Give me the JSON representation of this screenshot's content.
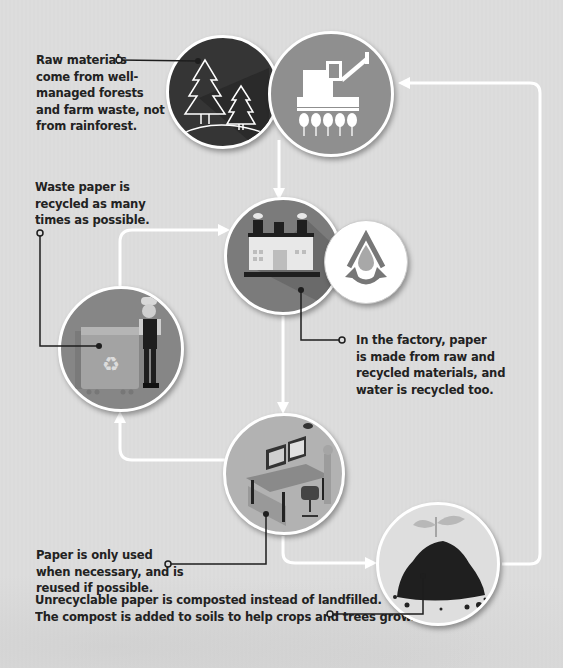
{
  "diagram": {
    "type": "paper-lifecycle-cycle",
    "stages": [
      {
        "id": "forest",
        "icon": "forest-trees-icon",
        "fill": "#3a3a3a"
      },
      {
        "id": "harvest",
        "icon": "combine-harvester-icon",
        "fill": "#8f8f8f"
      },
      {
        "id": "factory",
        "icon": "factory-icon",
        "fill": "#7d7d7d"
      },
      {
        "id": "water",
        "icon": "water-recycle-icon",
        "fill": "#ffffff"
      },
      {
        "id": "recycle",
        "icon": "recycling-bin-worker-icon",
        "fill": "#888888"
      },
      {
        "id": "office",
        "icon": "office-desk-icon",
        "fill": "#b5b5b5"
      },
      {
        "id": "compost",
        "icon": "compost-seedling-icon",
        "fill": "#dcdcdc"
      }
    ],
    "callouts": {
      "raw_materials": [
        "Raw materials",
        "come from well-",
        "managed forests",
        "and farm waste, not",
        "from rainforest."
      ],
      "waste_paper": [
        "Waste paper is",
        "recycled as many",
        "times as possible."
      ],
      "factory": [
        "In the factory, paper",
        "is made from raw and",
        "recycled materials, and",
        "water is recycled too."
      ],
      "usage": [
        "Paper is only used",
        "when necessary, and is",
        "reused if possible."
      ],
      "compost": [
        "Unrecyclable paper is composted instead of landfilled.",
        "The compost is added to soils to help crops and trees grow."
      ]
    },
    "colors": {
      "background": "#dddddd",
      "arrow": "#ffffff",
      "leader_line": "#222222",
      "text": "#222222"
    }
  }
}
